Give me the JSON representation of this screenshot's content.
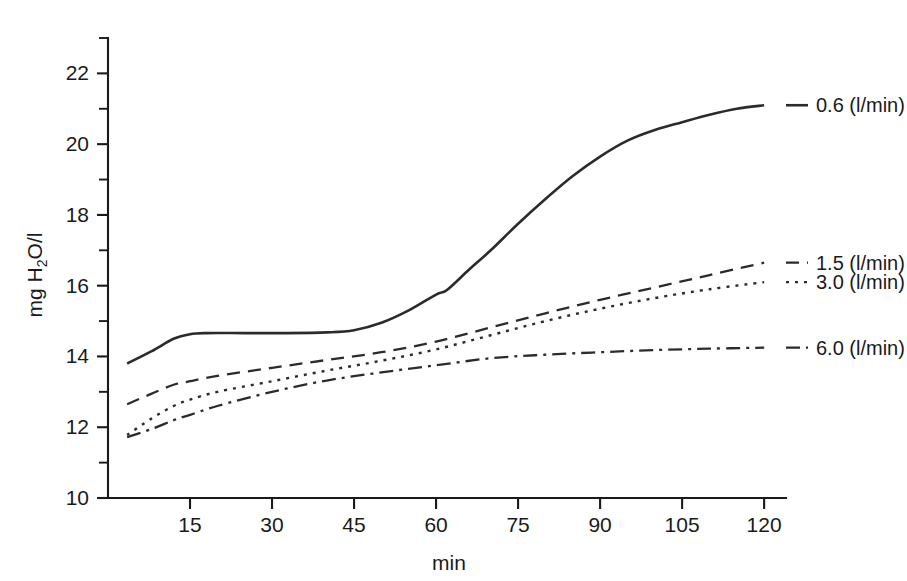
{
  "chart_data": {
    "type": "line",
    "title": "",
    "xlabel": "min",
    "ylabel": "mg H2O/l",
    "ylabel_parts": {
      "pre": "mg H",
      "sub": "2",
      "post": "O/l"
    },
    "xlim": [
      0,
      124
    ],
    "ylim": [
      10,
      23
    ],
    "xticks": [
      15,
      30,
      45,
      60,
      75,
      90,
      105,
      120
    ],
    "xtick_labels": [
      "15",
      "30",
      "45",
      "60",
      "75",
      "90",
      "105",
      "120"
    ],
    "yticks": [
      10,
      12,
      14,
      16,
      18,
      20,
      22
    ],
    "ytick_labels": [
      "10",
      "12",
      "14",
      "16",
      "18",
      "20",
      "22"
    ],
    "yticks_minor": [
      11,
      13,
      15,
      17,
      19,
      21,
      23
    ],
    "grid": false,
    "legend_position": "right-inline-labels",
    "series": [
      {
        "name": "0.6 (l/min)",
        "label": "0.6 (l/min)",
        "style": "solid",
        "dasharray": "none",
        "width": 2.6,
        "label_y": 21.1,
        "x": [
          3.5,
          8,
          12,
          15,
          18,
          25,
          32,
          40,
          45,
          50,
          55,
          60,
          62,
          66,
          70,
          75,
          80,
          85,
          90,
          95,
          100,
          105,
          110,
          115,
          120
        ],
        "y": [
          13.8,
          14.15,
          14.5,
          14.63,
          14.66,
          14.66,
          14.66,
          14.68,
          14.74,
          14.95,
          15.3,
          15.75,
          15.88,
          16.45,
          17.0,
          17.75,
          18.45,
          19.1,
          19.65,
          20.1,
          20.4,
          20.62,
          20.83,
          21.0,
          21.1
        ]
      },
      {
        "name": "1.5 (l/min)",
        "label": "1.5 (l/min)",
        "style": "dashed",
        "dasharray": "13,8",
        "width": 2.3,
        "label_y": 16.65,
        "x": [
          3.5,
          8,
          12,
          15,
          20,
          30,
          40,
          50,
          60,
          70,
          80,
          90,
          100,
          110,
          120
        ],
        "y": [
          12.65,
          12.95,
          13.2,
          13.3,
          13.45,
          13.68,
          13.9,
          14.12,
          14.42,
          14.82,
          15.22,
          15.6,
          15.95,
          16.3,
          16.65
        ]
      },
      {
        "name": "3.0 (l/min)",
        "label": "3.0 (l/min)",
        "style": "dotted",
        "dasharray": "3,6",
        "width": 2.4,
        "label_y": 16.1,
        "x": [
          3.5,
          8,
          12,
          15,
          20,
          30,
          40,
          50,
          60,
          70,
          80,
          90,
          100,
          110,
          120
        ],
        "y": [
          11.78,
          12.25,
          12.6,
          12.78,
          13.0,
          13.3,
          13.6,
          13.88,
          14.2,
          14.6,
          15.0,
          15.35,
          15.65,
          15.9,
          16.1
        ]
      },
      {
        "name": "6.0 (l/min)",
        "label": "6.0 (l/min)",
        "style": "dash-dot",
        "dasharray": "14,6,3,6",
        "width": 2.3,
        "label_y": 14.25,
        "x": [
          3.5,
          8,
          12,
          15,
          20,
          30,
          40,
          50,
          60,
          70,
          80,
          90,
          100,
          110,
          120
        ],
        "y": [
          11.72,
          11.95,
          12.2,
          12.35,
          12.6,
          13.0,
          13.32,
          13.55,
          13.75,
          13.95,
          14.05,
          14.12,
          14.18,
          14.22,
          14.25
        ]
      }
    ],
    "colors": {
      "line": "#2b2b2b",
      "axis": "#1a1a1a",
      "background": "#ffffff"
    }
  }
}
